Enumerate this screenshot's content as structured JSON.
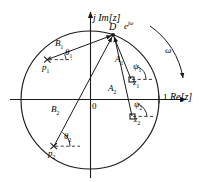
{
  "figure": {
    "type": "z-plane pole-zero diagram",
    "unit_circle": {
      "center": [
        90,
        100
      ],
      "radius": 69
    },
    "axes": {
      "imaginary_label": "j Im[z]",
      "real_label": "Re[z]",
      "real_tick_label": "1",
      "origin_label": "0"
    },
    "evaluation_point": {
      "name": "D",
      "exponential_label_base": "e",
      "exponential_label_exp": "jω",
      "position": [
        113,
        34
      ]
    },
    "frequency_arrow_label": "ω",
    "poles": [
      {
        "label": "p",
        "index": "1",
        "position": [
          47,
          60
        ],
        "vector_label": "B",
        "vector_index": "1",
        "angle_label": "θ",
        "angle_index": "1"
      },
      {
        "label": "p",
        "index": "2",
        "position": [
          53,
          147
        ],
        "vector_label": "B",
        "vector_index": "2",
        "angle_label": "θ",
        "angle_index": "2"
      }
    ],
    "zeros": [
      {
        "label": "z",
        "index": "1",
        "position": [
          132,
          80
        ],
        "vector_label": "A",
        "vector_index": "1",
        "angle_label": "ψ",
        "angle_index": "1"
      },
      {
        "label": "z",
        "index": "2",
        "position": [
          133,
          117
        ],
        "vector_label": "A",
        "vector_index": "2",
        "angle_label": "ψ",
        "angle_index": "2"
      }
    ],
    "labels": {
      "im_axis": "j Im[z]",
      "re_axis": "Re[z]",
      "one": "1",
      "origin": "0",
      "D": "D",
      "e": "e",
      "jw": "jω",
      "omega": "ω",
      "B1": "B",
      "B1s": "1",
      "B2": "B",
      "B2s": "2",
      "A1": "A",
      "A1s": "1",
      "A2": "A",
      "A2s": "2",
      "th1": "θ",
      "th1s": "1",
      "th2": "θ",
      "th2s": "2",
      "ps1": "ψ",
      "ps1s": "1",
      "ps2": "ψ",
      "ps2s": "2",
      "p1": "p",
      "p1s": "1",
      "p2": "p",
      "p2s": "2",
      "z1": "z",
      "z1s": "1",
      "z2": "z",
      "z2s": "2"
    },
    "colors": {
      "stroke": "#1a1a1a",
      "background": "#ffffff"
    }
  }
}
